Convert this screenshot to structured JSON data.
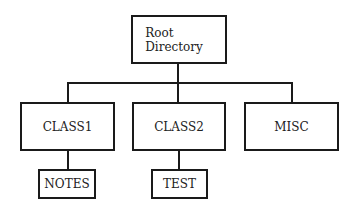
{
  "diagram": {
    "type": "directory-tree",
    "root": {
      "label_line1": "Root",
      "label_line2": "Directory"
    },
    "children": [
      {
        "label": "CLASS1",
        "children": [
          {
            "label": "NOTES"
          }
        ]
      },
      {
        "label": "CLASS2",
        "children": [
          {
            "label": "TEST"
          }
        ]
      },
      {
        "label": "MISC",
        "children": []
      }
    ]
  }
}
